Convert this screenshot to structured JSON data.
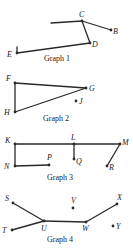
{
  "graphs": [
    {
      "caption": "Graph 1",
      "vertices": [
        {
          "id": "B",
          "label": "B"
        },
        {
          "id": "C",
          "label": "C"
        },
        {
          "id": "D",
          "label": "D"
        },
        {
          "id": "E",
          "label": "E"
        }
      ],
      "edges": [
        [
          "C",
          "open-end"
        ],
        [
          "C",
          "B"
        ],
        [
          "C",
          "D"
        ],
        [
          "D",
          "E"
        ],
        [
          "E",
          "open-tick"
        ]
      ]
    },
    {
      "caption": "Graph 2",
      "vertices": [
        {
          "id": "F",
          "label": "F"
        },
        {
          "id": "G",
          "label": "G"
        },
        {
          "id": "H",
          "label": "H"
        },
        {
          "id": "J",
          "label": "J"
        }
      ],
      "edges": [
        [
          "F",
          "G"
        ],
        [
          "F",
          "H"
        ],
        [
          "H",
          "G"
        ]
      ]
    },
    {
      "caption": "Graph 3",
      "vertices": [
        {
          "id": "K",
          "label": "K"
        },
        {
          "id": "L",
          "label": "L"
        },
        {
          "id": "M",
          "label": "M"
        },
        {
          "id": "N",
          "label": "N"
        },
        {
          "id": "P",
          "label": "P"
        },
        {
          "id": "Q",
          "label": "Q"
        },
        {
          "id": "R",
          "label": "R"
        }
      ],
      "edges": [
        [
          "K",
          "L"
        ],
        [
          "L",
          "M"
        ],
        [
          "K",
          "N"
        ],
        [
          "N",
          "P"
        ],
        [
          "L",
          "Q"
        ],
        [
          "M",
          "R"
        ]
      ]
    },
    {
      "caption": "Graph 4",
      "vertices": [
        {
          "id": "S",
          "label": "S"
        },
        {
          "id": "T",
          "label": "T"
        },
        {
          "id": "U",
          "label": "U"
        },
        {
          "id": "V",
          "label": "V"
        },
        {
          "id": "W",
          "label": "W"
        },
        {
          "id": "X",
          "label": "X"
        },
        {
          "id": "Y",
          "label": "Y"
        }
      ],
      "edges": [
        [
          "S",
          "U"
        ],
        [
          "T",
          "U"
        ],
        [
          "U",
          "W"
        ],
        [
          "W",
          "X"
        ]
      ]
    }
  ]
}
